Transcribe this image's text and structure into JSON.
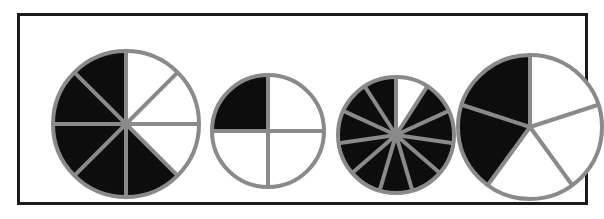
{
  "figure": {
    "background_color": "#ffffff",
    "frame": {
      "border_color": "#1b1b1b",
      "border_width": 3,
      "x": 17,
      "y": 13,
      "width": 571,
      "height": 192
    },
    "style": {
      "sector_line_color": "#8a8a8a",
      "sector_line_width": 4,
      "outline_color": "#8a8a8a",
      "outline_width": 4,
      "shaded_color": "#0d0d0d",
      "unshaded_color": "#ffffff"
    }
  },
  "chart_data": {
    "type": "pie",
    "xlabel": "",
    "ylabel": "",
    "legend": [],
    "grid": false,
    "series": [
      {
        "name": "circle-1",
        "total_sectors": 8,
        "shaded_sectors": 5,
        "unshaded_sectors": 3,
        "fraction_shaded": "5/8",
        "start_angle_deg": 0,
        "shaded_indices": [
          3,
          4,
          5,
          6,
          7
        ],
        "center_x": 106,
        "center_y": 108,
        "radius": 73,
        "values": [
          12.5,
          12.5,
          12.5,
          12.5,
          12.5,
          12.5,
          12.5,
          12.5
        ]
      },
      {
        "name": "circle-2",
        "total_sectors": 4,
        "shaded_sectors": 1,
        "unshaded_sectors": 3,
        "fraction_shaded": "1/4",
        "start_angle_deg": 0,
        "shaded_indices": [
          3
        ],
        "center_x": 248,
        "center_y": 115,
        "radius": 56,
        "values": [
          25,
          25,
          25,
          25
        ]
      },
      {
        "name": "circle-3",
        "total_sectors": 11,
        "shaded_sectors": 10,
        "unshaded_sectors": 1,
        "fraction_shaded": "10/11",
        "start_angle_deg": 0,
        "shaded_indices": [
          1,
          2,
          3,
          4,
          5,
          6,
          7,
          8,
          9,
          10
        ],
        "center_x": 376,
        "center_y": 119,
        "radius": 58,
        "values": [
          9.09,
          9.09,
          9.09,
          9.09,
          9.09,
          9.09,
          9.09,
          9.09,
          9.09,
          9.09,
          9.09
        ]
      },
      {
        "name": "circle-4",
        "total_sectors": 5,
        "shaded_sectors": 2,
        "unshaded_sectors": 3,
        "fraction_shaded": "2/5",
        "start_angle_deg": 0,
        "shaded_indices": [
          3,
          4
        ],
        "center_x": 510,
        "center_y": 111,
        "radius": 72,
        "values": [
          20,
          20,
          20,
          20,
          20
        ]
      }
    ]
  }
}
